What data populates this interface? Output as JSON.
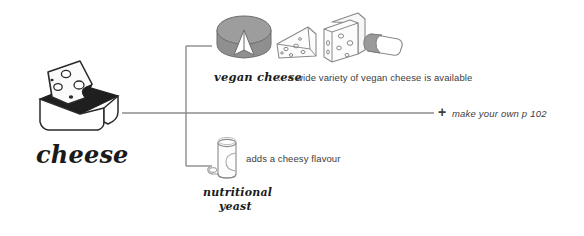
{
  "diagram": {
    "title": "cheese",
    "background_color": "#ffffff",
    "line_color": "#8c8c8c",
    "text_color": "#3d3d3d"
  },
  "root": {
    "label": "cheese",
    "icon": "cheese-box-icon"
  },
  "branches": [
    {
      "id": "vegan-cheese",
      "label": "vegan cheese",
      "separator": ":",
      "description": "a wide variety of vegan cheese is available",
      "icons": [
        "cheese-wheel-icon",
        "cheese-wedge-icon",
        "cheese-block-icon",
        "cheese-log-icon"
      ]
    },
    {
      "id": "nutritional-yeast",
      "label_line_1": "nutritional",
      "label_line_2": "yeast",
      "description": "adds a cheesy flavour",
      "icons": [
        "yeast-jar-icon"
      ]
    }
  ],
  "footer": {
    "plus": "+",
    "text": "make your own p 102"
  }
}
